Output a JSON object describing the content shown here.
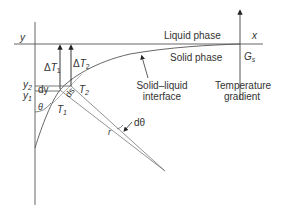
{
  "diagram": {
    "axes": {
      "y_label": "y",
      "x_label": "x"
    },
    "phases": {
      "liquid": "Liquid phase",
      "solid": "Solid phase"
    },
    "gradient": {
      "symbol": "G",
      "subscript": "s",
      "caption_line1": "Temperature",
      "caption_line2": "gradient"
    },
    "interface": {
      "caption_line1": "Solid–liquid",
      "caption_line2": "interface"
    },
    "temps": {
      "dT1": {
        "prefix": "Δ",
        "symbol": "T",
        "subscript": "1"
      },
      "dT2": {
        "prefix": "Δ",
        "symbol": "T",
        "subscript": "2"
      },
      "T1": {
        "symbol": "T",
        "subscript": "1"
      },
      "T2": {
        "symbol": "T",
        "subscript": "2"
      }
    },
    "heights": {
      "y2": {
        "symbol": "y",
        "subscript": "2"
      },
      "y1": {
        "symbol": "y",
        "subscript": "1"
      },
      "dy": "dy"
    },
    "arc": {
      "ds": "ds",
      "theta": "θ",
      "dtheta": "dθ",
      "r": "r"
    },
    "colors": {
      "line": "#333333",
      "light_line": "#777777"
    }
  }
}
